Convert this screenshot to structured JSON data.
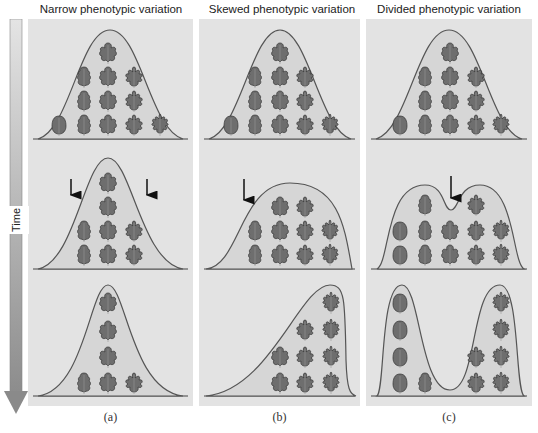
{
  "time_axis": {
    "label": "Time",
    "direction": "down"
  },
  "panels": [
    {
      "title": "Narrow phenotypic variation",
      "caption": "(a)",
      "generations": [
        "initial normal distribution",
        "selection against both extremes (arrows)",
        "narrowed distribution"
      ]
    },
    {
      "title": "Skewed phenotypic variation",
      "caption": "(b)",
      "generations": [
        "initial normal distribution",
        "selection against one extreme (arrow)",
        "skewed distribution"
      ]
    },
    {
      "title": "Divided phenotypic variation",
      "caption": "(c)",
      "generations": [
        "initial normal distribution",
        "selection against intermediate (arrow)",
        "bimodal distribution"
      ]
    }
  ],
  "colors": {
    "panel_bg": "#e3e3e3",
    "curve": "#555555",
    "leaf": "#6e6e6e",
    "leaf_edge": "#333333",
    "arrow": "#111111",
    "time_bar": "#9a9a9a"
  }
}
